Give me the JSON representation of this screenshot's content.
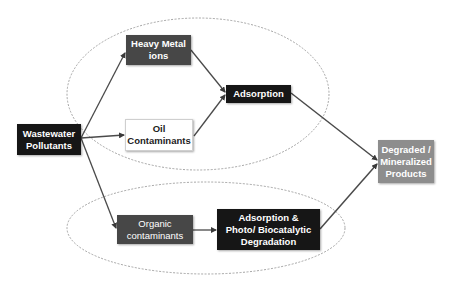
{
  "diagram": {
    "nodes": {
      "wastewater": {
        "label": "Wastewater\nPollutants"
      },
      "heavy_metal": {
        "label": "Heavy Metal\nions"
      },
      "oil": {
        "label": "Oil\nContaminants"
      },
      "adsorption": {
        "label": "Adsorption"
      },
      "organic": {
        "label": "Organic\ncontaminants"
      },
      "adsorption_photo": {
        "label": "Adsorption &\nPhoto/ Biocatalytic\nDegradation"
      },
      "degraded": {
        "label": "Degraded /\nMineralized\nProducts"
      }
    },
    "edges": [
      {
        "from": "wastewater",
        "to": "heavy_metal"
      },
      {
        "from": "wastewater",
        "to": "oil"
      },
      {
        "from": "wastewater",
        "to": "organic"
      },
      {
        "from": "heavy_metal",
        "to": "adsorption"
      },
      {
        "from": "oil",
        "to": "adsorption"
      },
      {
        "from": "adsorption",
        "to": "degraded"
      },
      {
        "from": "organic",
        "to": "adsorption_photo"
      },
      {
        "from": "adsorption_photo",
        "to": "degraded"
      }
    ],
    "groups": [
      {
        "name": "top-group",
        "members": [
          "heavy_metal",
          "oil",
          "adsorption"
        ]
      },
      {
        "name": "bottom-group",
        "members": [
          "organic",
          "adsorption_photo"
        ]
      }
    ],
    "colors": {
      "dark_box": "#161616",
      "mid_box": "#474747",
      "light_box": "#ffffff",
      "gray_box": "#8d8d8d",
      "arrow": "#4a4a4a",
      "group_outline": "#9a9a9a"
    }
  }
}
